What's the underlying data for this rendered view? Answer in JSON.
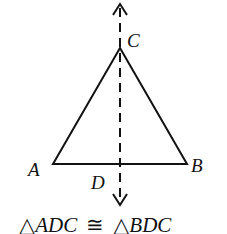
{
  "diagram": {
    "points": {
      "A": {
        "label": "A",
        "x": 53,
        "y": 164
      },
      "B": {
        "label": "B",
        "x": 187,
        "y": 164
      },
      "C": {
        "label": "C",
        "x": 120,
        "y": 48
      },
      "D": {
        "label": "D",
        "x": 120,
        "y": 164
      }
    },
    "line": {
      "style": "dashed",
      "arrows": "both",
      "x": 120,
      "y_top": 5,
      "y_bottom": 205
    },
    "caption": {
      "tri1_symbol": "△",
      "tri1": "ADC",
      "congruent": "≅",
      "tri2_symbol": "△",
      "tri2": "BDC"
    },
    "stroke_color": "#111111"
  }
}
